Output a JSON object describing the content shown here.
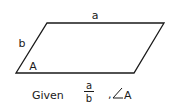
{
  "diagram": {
    "shape": "parallelogram",
    "vertices": {
      "top_left": [
        47,
        23
      ],
      "top_right": [
        164,
        23
      ],
      "bottom_right": [
        134,
        73
      ],
      "bottom_left": [
        16,
        73
      ]
    },
    "stroke_color": "#1a1a1a",
    "labels": {
      "top_side": "a",
      "left_side": "b",
      "angle": "A"
    }
  },
  "caption": {
    "prefix": "Given",
    "fraction": {
      "numerator": "a",
      "denominator": "b"
    },
    "separator": ",",
    "angle_symbol": "∠",
    "angle_label": "A"
  }
}
